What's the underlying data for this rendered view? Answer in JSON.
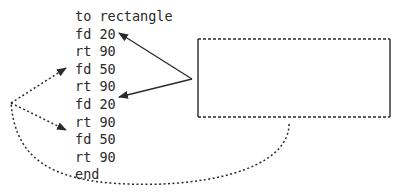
{
  "procedure": {
    "lines": [
      "to rectangle",
      "fd 20",
      "rt 90",
      "fd 50",
      "rt 90",
      "fd 20",
      "rt 90",
      "fd 50",
      "rt 90",
      "end"
    ]
  },
  "diagram": {
    "rectangle": {
      "width_label": "fd 50",
      "height_label": "fd 20",
      "sides": {
        "short": "solid",
        "long": "dashed"
      }
    },
    "arrows": [
      {
        "style": "solid",
        "from": "rectangle short sides",
        "to": [
          "fd 20 (line 2)",
          "fd 20 (line 6)"
        ]
      },
      {
        "style": "dotted",
        "from": "rectangle long sides",
        "to": [
          "fd 50 (line 4)",
          "fd 50 (line 8)"
        ]
      }
    ],
    "colors": {
      "ink": "#2a2a2a",
      "background": "#ffffff"
    }
  }
}
